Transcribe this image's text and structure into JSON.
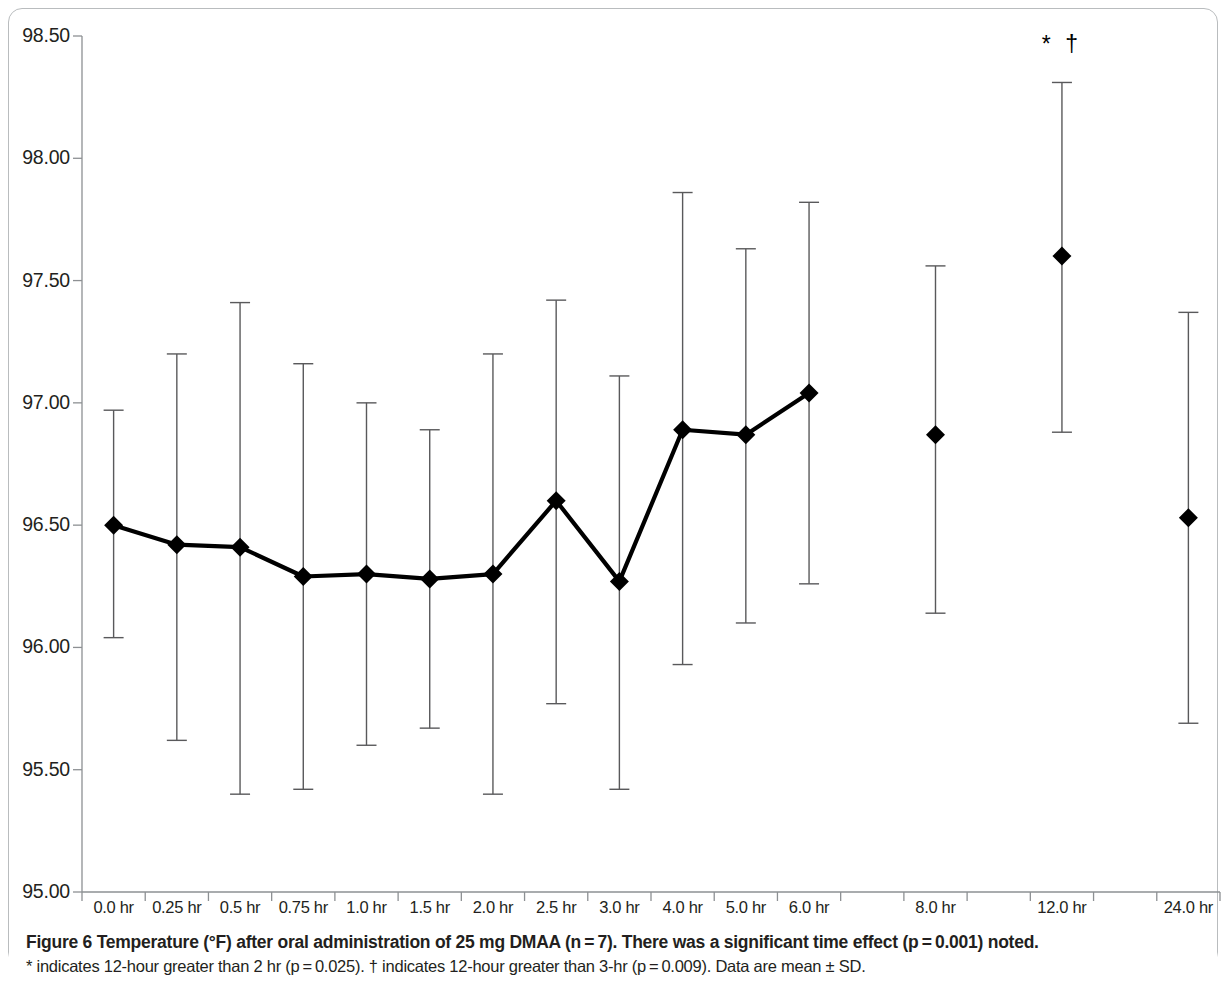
{
  "figure": {
    "caption_main": "Figure 6 Temperature (°F) after oral administration of 25 mg DMAA (n = 7). There was a significant time effect (p = 0.001) noted.",
    "caption_sub": "* indicates 12-hour greater than 2 hr (p = 0.025). † indicates 12-hour greater than 3-hr (p = 0.009). Data are mean ± SD.",
    "significance_marker": "* †",
    "significance_marker_at": "12.0 hr"
  },
  "chart_data": {
    "type": "line",
    "title": "",
    "xlabel": "",
    "ylabel": "",
    "ylim": [
      95.0,
      98.5
    ],
    "ytick_step": 0.5,
    "ytick_labels": [
      "98.50",
      "98.00",
      "97.50",
      "97.00",
      "96.50",
      "96.00",
      "95.50",
      "95.00"
    ],
    "ytick_values": [
      98.5,
      98.0,
      97.5,
      97.0,
      96.5,
      96.0,
      95.5,
      95.0
    ],
    "grid": false,
    "legend": null,
    "categories": [
      "0.0 hr",
      "0.25 hr",
      "0.5 hr",
      "0.75 hr",
      "1.0 hr",
      "1.5 hr",
      "2.0 hr",
      "2.5 hr",
      "3.0 hr",
      "4.0 hr",
      "5.0 hr",
      "6.0 hr",
      "",
      "8.0 hr",
      "",
      "12.0 hr",
      "",
      "24.0 hr"
    ],
    "series": [
      {
        "name": "Temperature (°F)",
        "marker": "diamond",
        "color": "#000000",
        "connected_through_index": 11,
        "values": [
          96.5,
          96.42,
          96.41,
          96.29,
          96.3,
          96.28,
          96.3,
          96.6,
          96.27,
          96.89,
          96.87,
          97.04,
          null,
          96.87,
          null,
          97.6,
          null,
          96.53
        ],
        "error_upper": [
          96.97,
          97.2,
          97.41,
          97.16,
          97.0,
          96.89,
          97.2,
          97.42,
          97.11,
          97.86,
          97.63,
          97.82,
          null,
          97.56,
          null,
          98.31,
          null,
          97.37
        ],
        "error_lower": [
          96.04,
          95.62,
          95.4,
          95.42,
          95.6,
          95.67,
          95.4,
          95.77,
          95.42,
          95.93,
          96.1,
          96.26,
          null,
          96.14,
          null,
          96.88,
          null,
          95.69
        ]
      }
    ],
    "annotations": [
      {
        "text": "* †",
        "category": "12.0 hr",
        "value": 98.48
      }
    ]
  }
}
